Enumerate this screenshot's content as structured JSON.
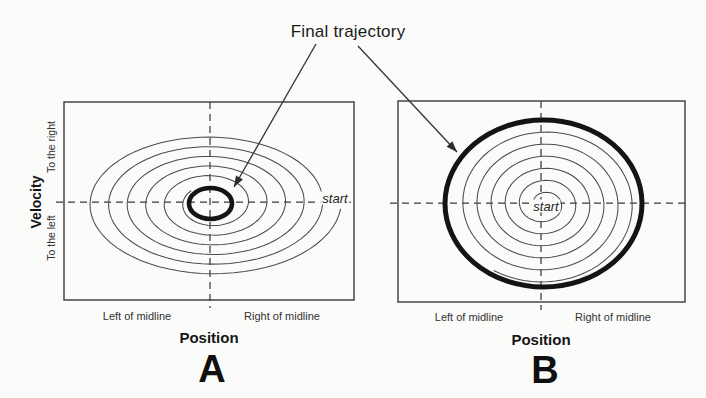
{
  "title": {
    "text": "Final trajectory"
  },
  "panel_a": {
    "letter": "A",
    "xlabel": "Position",
    "x_left": "Left of midline",
    "x_right": "Right of midline",
    "ylabel": "Velocity",
    "y_top": "To the right",
    "y_bottom": "To the left",
    "start": "start"
  },
  "panel_b": {
    "letter": "B",
    "xlabel": "Position",
    "x_left": "Left of midline",
    "x_right": "Right of midline",
    "start": "start"
  },
  "colors": {
    "ink": "#1b1b1b",
    "thin_line": "#4b4b4b",
    "bold_trajectory": "#141414",
    "background": "#fbfbfa"
  },
  "geometry": {
    "panel_a": {
      "frame": {
        "x": 64,
        "y": 102,
        "w": 290,
        "h": 198
      },
      "axis_cross": {
        "x": 210,
        "y": 202
      },
      "dash_h": {
        "x1": 56,
        "x2": 355
      },
      "dash_v": {
        "y1": 102,
        "y2": 308
      },
      "spiral": {
        "cx": 211,
        "cy": 203,
        "rx0": 130,
        "ry0": 73,
        "rx1": 26,
        "ry1": 19,
        "turns": 5.6,
        "theta0": 0.08
      },
      "limit_cycle": {
        "cx": 210.5,
        "cy": 203.5,
        "rx": 21.5,
        "ry": 15.5,
        "stroke_width": 4.6
      }
    },
    "panel_b": {
      "frame": {
        "x": 398,
        "y": 101,
        "w": 287,
        "h": 201
      },
      "axis_cross": {
        "x": 541,
        "y": 203
      },
      "dash_h": {
        "x1": 390,
        "x2": 685
      },
      "dash_v": {
        "y1": 101,
        "y2": 310
      },
      "spiral": {
        "cx": 544,
        "cy": 204,
        "rx0": 11,
        "ry0": 9,
        "rx1": 93,
        "ry1": 79,
        "turns": 5.8,
        "theta0": 3.4
      },
      "limit_cycle": {
        "cx": 543.5,
        "cy": 203.5,
        "rx": 98.5,
        "ry": 83.5,
        "stroke_width": 5
      }
    },
    "arrows": [
      {
        "x1": 316,
        "y1": 44,
        "x2": 234,
        "y2": 187
      },
      {
        "x1": 358,
        "y1": 46,
        "x2": 457,
        "y2": 152
      }
    ]
  }
}
